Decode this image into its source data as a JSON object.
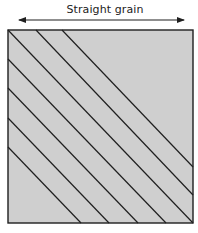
{
  "diagram": {
    "label": "Straight grain",
    "colors": {
      "fill": "#cfcfcf",
      "stroke": "#1f1f1f",
      "text": "#222222"
    },
    "arrow": {
      "x1": 19,
      "y1": 20,
      "x2": 184,
      "y2": 20,
      "direction": "both"
    },
    "square": {
      "x": 8,
      "y": 30,
      "width": 185,
      "height": 193
    },
    "diagonal_lines": [
      {
        "x1": 62,
        "y1": 30,
        "x2": 193,
        "y2": 167
      },
      {
        "x1": 36,
        "y1": 30,
        "x2": 193,
        "y2": 195
      },
      {
        "x1": 8,
        "y1": 30,
        "x2": 193,
        "y2": 223
      },
      {
        "x1": 8,
        "y1": 59,
        "x2": 166,
        "y2": 223
      },
      {
        "x1": 8,
        "y1": 88,
        "x2": 138,
        "y2": 223
      },
      {
        "x1": 8,
        "y1": 118,
        "x2": 109,
        "y2": 223
      },
      {
        "x1": 8,
        "y1": 147,
        "x2": 81,
        "y2": 223
      }
    ]
  }
}
